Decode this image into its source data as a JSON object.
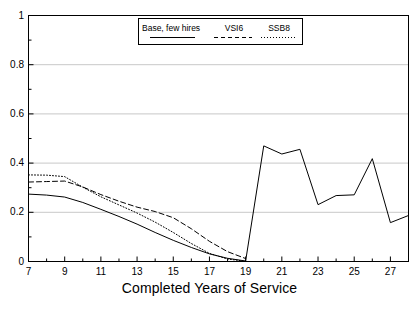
{
  "chart_data": {
    "type": "line",
    "title": "",
    "xlabel": "Completed Years of Service",
    "ylabel": "",
    "xlim": [
      7,
      28
    ],
    "ylim": [
      0,
      1
    ],
    "grid": true,
    "grid_axis": "y",
    "legend_position": "top-center",
    "x_ticks": [
      7,
      9,
      11,
      13,
      15,
      17,
      19,
      21,
      23,
      25,
      27
    ],
    "x_minor_ticks": [
      8,
      10,
      12,
      14,
      16,
      18,
      20,
      22,
      24,
      26,
      28
    ],
    "y_ticks": [
      0,
      0.2,
      0.4,
      0.6,
      0.8,
      1
    ],
    "y_tick_labels": [
      "0",
      "0.2",
      "0.4",
      "0.6",
      "0.8",
      "1"
    ],
    "y_minor_ticks": [
      0.1,
      0.3,
      0.5,
      0.7,
      0.9
    ],
    "x": [
      7,
      8,
      9,
      10,
      11,
      12,
      13,
      14,
      15,
      16,
      17,
      18,
      19,
      20,
      21,
      22,
      23,
      24,
      25,
      26,
      27,
      28
    ],
    "series": [
      {
        "name": "Base, few hires",
        "style": "solid",
        "color": "#000000",
        "values": [
          0.274,
          0.27,
          0.262,
          0.24,
          0.212,
          0.183,
          0.152,
          0.118,
          0.086,
          0.057,
          0.031,
          0.013,
          0.002,
          0.47,
          0.437,
          0.456,
          0.231,
          0.268,
          0.271,
          0.418,
          0.158,
          0.187
        ]
      },
      {
        "name": "VSI6",
        "style": "dashed",
        "color": "#000000",
        "values": [
          0.323,
          0.325,
          0.327,
          0.303,
          0.272,
          0.245,
          0.221,
          0.203,
          0.178,
          0.133,
          0.082,
          0.04,
          0.012,
          null,
          null,
          null,
          null,
          null,
          null,
          null,
          null,
          null
        ]
      },
      {
        "name": "SSB8",
        "style": "dotted",
        "color": "#000000",
        "values": [
          0.352,
          0.351,
          0.345,
          0.302,
          0.263,
          0.23,
          0.197,
          0.16,
          0.118,
          0.073,
          0.033,
          0.01,
          0.001,
          null,
          null,
          null,
          null,
          null,
          null,
          null,
          null,
          null
        ]
      }
    ]
  },
  "legend": {
    "items": [
      {
        "label": "Base, few hires",
        "style": "solid"
      },
      {
        "label": "VSI6",
        "style": "dashed"
      },
      {
        "label": "SSB8",
        "style": "dotted"
      }
    ]
  },
  "axes": {
    "x_title": "Completed Years of Service",
    "y_tick_labels": [
      "1",
      "0.8",
      "0.6",
      "0.4",
      "0.2",
      "0"
    ],
    "x_tick_labels": [
      "7",
      "9",
      "11",
      "13",
      "15",
      "17",
      "19",
      "21",
      "23",
      "25",
      "27"
    ]
  },
  "colors": {
    "frame": "#000000",
    "grid": "#c8c8c8",
    "line": "#000000",
    "background": "#ffffff"
  }
}
